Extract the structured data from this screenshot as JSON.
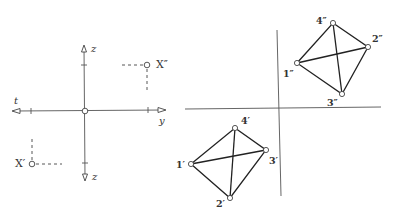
{
  "figure": {
    "left_panel": {
      "title": "axis system",
      "axes": {
        "t_label": "t",
        "y_label": "y",
        "z_top_label": "z",
        "z_bottom_label": "z"
      },
      "points": {
        "x_double_prime": "X″",
        "x_prime": "X′"
      }
    },
    "right_panel": {
      "upper_projection": {
        "v1": "1″",
        "v2": "2″",
        "v3": "3″",
        "v4": "4″"
      },
      "lower_projection": {
        "v1": "1′",
        "v2": "2′",
        "v3": "3′",
        "v4": "4′"
      }
    }
  }
}
